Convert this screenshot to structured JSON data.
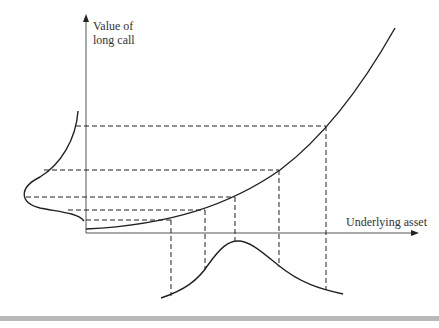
{
  "diagram": {
    "y_axis_label_line1": "Value of",
    "y_axis_label_line2": "long call",
    "x_axis_label": "Underlying asset",
    "colors": {
      "line": "#222222",
      "axis": "#555555",
      "bar": "#b8b8b8"
    }
  }
}
